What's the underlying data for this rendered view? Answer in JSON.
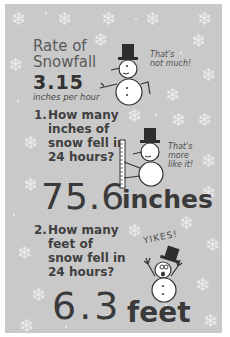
{
  "infographic": {
    "title_line1": "Rate of",
    "title_line2": "Snowfall",
    "rate_value": "3.15",
    "rate_unit": "inches per hour",
    "snowman1_bubble_line1": "That's",
    "snowman1_bubble_line2": "not much!",
    "question1": {
      "number": "1.",
      "line1": "How many",
      "line2": "inches of",
      "line3": "snow fell in",
      "line4": "24 hours?"
    },
    "snowman2_bubble_line1": "That's",
    "snowman2_bubble_line2": "more",
    "snowman2_bubble_line3": "like it!",
    "answer1_value": "75.6",
    "answer1_unit": "inches",
    "question2": {
      "number": "2.",
      "line1": "How many",
      "line2": "feet of",
      "line3": "snow fell in",
      "line4": "24 hours?"
    },
    "snowman3_exclaim": "YIKES!",
    "answer2_value": "6.3",
    "answer2_unit": "feet"
  },
  "colors": {
    "background": "#c9c9c9",
    "border": "#ffffff",
    "text_dark": "#3a3a3a",
    "snowflake": "#ececec"
  },
  "icons": [
    "snowflake-icon",
    "snowman-icon",
    "ruler-icon",
    "top-hat-icon"
  ]
}
